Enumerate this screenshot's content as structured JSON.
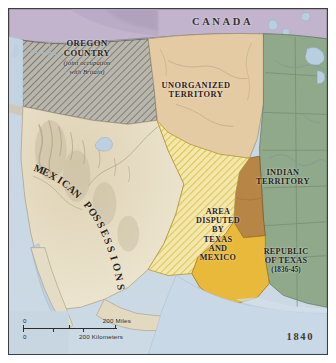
{
  "map": {
    "year": "1840",
    "regions": [
      {
        "id": "canada",
        "label": "CANADA",
        "fill": "#c3b4cd"
      },
      {
        "id": "oregon-country",
        "label": "OREGON COUNTRY",
        "sublabel": "(joint occupation with Britain)",
        "fill": "#a9a9a2"
      },
      {
        "id": "unorganized-territory",
        "label": "UNORGANIZED TERRITORY",
        "fill": "#e4cba4"
      },
      {
        "id": "indian-territory",
        "label": "INDIAN TERRITORY",
        "fill": "#b78545"
      },
      {
        "id": "republic-of-texas",
        "label": "REPUBLIC OF TEXAS",
        "sublabel": "(1836-45)",
        "fill": "#e8b93a"
      },
      {
        "id": "disputed-area",
        "label": "AREA DISPUTED BY TEXAS AND MEXICO",
        "fill": "#efe0a4"
      },
      {
        "id": "mexican-possessions",
        "label": "MEXICAN POSSESSIONS",
        "fill": "#ece3cd"
      },
      {
        "id": "united-states",
        "label": "",
        "fill": "#8fa98a"
      },
      {
        "id": "ocean",
        "label": "",
        "fill": "#c6d5e3"
      }
    ],
    "labels": {
      "canada": "CANADA",
      "oregon_line1": "OREGON",
      "oregon_line2": "COUNTRY",
      "oregon_sub1": "(joint occupation",
      "oregon_sub2": "with Britain)",
      "unorganized_line1": "UNORGANIZED",
      "unorganized_line2": "TERRITORY",
      "indian_line1": "INDIAN",
      "indian_line2": "TERRITORY",
      "texas_line1": "REPUBLIC",
      "texas_line2": "OF TEXAS",
      "texas_years": "(1836-45)",
      "disputed_line1": "AREA",
      "disputed_line2": "DISPUTED",
      "disputed_line3": "BY",
      "disputed_line4": "TEXAS",
      "disputed_line5": "AND",
      "disputed_line6": "MEXICO",
      "mexican": "MEXICAN POSSESSIONS"
    },
    "scale": {
      "miles_zero": "0",
      "miles_value": "200 Miles",
      "km_zero": "0",
      "km_value": "200 Kilometers"
    }
  }
}
